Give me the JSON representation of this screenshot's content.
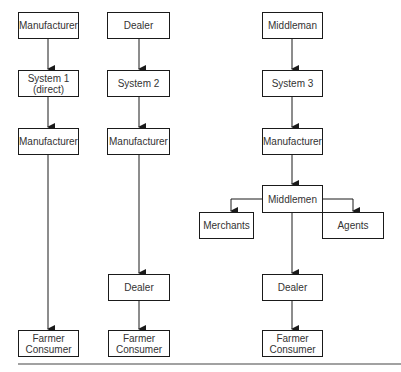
{
  "diagram": {
    "type": "flowchart",
    "columns": [
      {
        "name": "system-1",
        "nodes": [
          "Manufacturer",
          "System 1\n(direct)",
          "Manufacturer",
          "Farmer\nConsumer"
        ]
      },
      {
        "name": "system-2",
        "nodes": [
          "Dealer",
          "System 2",
          "Manufacturer",
          "Dealer",
          "Farmer\nConsumer"
        ]
      },
      {
        "name": "system-3",
        "nodes": [
          "Middleman",
          "System 3",
          "Manufacturer",
          "Middlemen",
          "Merchants",
          "Agents",
          "Dealer",
          "Farmer\nConsumer"
        ]
      }
    ],
    "edges": [
      [
        "Manufacturer (top, col1)",
        "System 1 (direct)"
      ],
      [
        "System 1 (direct)",
        "Manufacturer (col1)"
      ],
      [
        "Manufacturer (col1)",
        "Farmer Consumer (col1)"
      ],
      [
        "Dealer (top, col2)",
        "System 2"
      ],
      [
        "System 2",
        "Manufacturer (col2)"
      ],
      [
        "Manufacturer (col2)",
        "Dealer (col2)"
      ],
      [
        "Dealer (col2)",
        "Farmer Consumer (col2)"
      ],
      [
        "Middleman",
        "System 3"
      ],
      [
        "System 3",
        "Manufacturer (col3)"
      ],
      [
        "Manufacturer (col3)",
        "Middlemen"
      ],
      [
        "Middlemen",
        "Merchants"
      ],
      [
        "Middlemen",
        "Agents"
      ],
      [
        "Middlemen",
        "Dealer (col3)"
      ],
      [
        "Dealer (col3)",
        "Farmer Consumer (col3)"
      ]
    ],
    "colors": {
      "line": "#1a1a1a",
      "text": "#333333",
      "background": "#ffffff"
    }
  },
  "col1": {
    "top": "Manufacturer",
    "system": "System 1\n(direct)",
    "manufacturer": "Manufacturer",
    "farmer": "Farmer\nConsumer"
  },
  "col2": {
    "top": "Dealer",
    "system": "System 2",
    "manufacturer": "Manufacturer",
    "dealer": "Dealer",
    "farmer": "Farmer\nConsumer"
  },
  "col3": {
    "top": "Middleman",
    "system": "System 3",
    "manufacturer": "Manufacturer",
    "middlemen": "Middlemen",
    "merchants": "Merchants",
    "agents": "Agents",
    "dealer": "Dealer",
    "farmer": "Farmer\nConsumer"
  }
}
